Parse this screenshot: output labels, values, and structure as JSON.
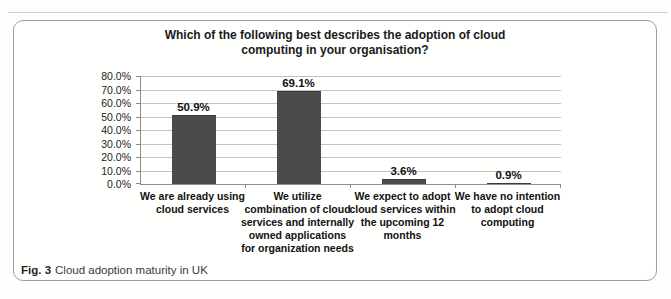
{
  "page": {
    "caption": {
      "label": "Fig. 3",
      "text": "Cloud adoption maturity in UK"
    }
  },
  "chart_data": {
    "type": "bar",
    "title": "Which of the following best describes the adoption of cloud computing in your organisation?",
    "categories": [
      "We are already using cloud services",
      "We utilize combination of cloud services and internally owned applications for organization needs",
      "We expect to adopt cloud services within the upcoming 12 months",
      "We have no intention to adopt cloud computing"
    ],
    "categories_wrapped": [
      [
        "We are already using",
        "cloud services"
      ],
      [
        "We utilize",
        "combination of cloud",
        "services and internally",
        "owned applications",
        "for organization needs"
      ],
      [
        "We expect to adopt",
        "cloud services within",
        "the upcoming 12",
        "months"
      ],
      [
        "We have no intention",
        "to adopt cloud",
        "computing"
      ]
    ],
    "values": [
      50.9,
      69.1,
      3.6,
      0.9
    ],
    "value_labels": [
      "50.9%",
      "69.1%",
      "3.6%",
      "0.9%"
    ],
    "xlabel": "",
    "ylabel": "",
    "ylim": [
      0,
      80
    ],
    "ytick_step": 10,
    "ytick_labels": [
      "0.0%",
      "10.0%",
      "20.0%",
      "30.0%",
      "40.0%",
      "50.0%",
      "60.0%",
      "70.0%",
      "80.0%"
    ],
    "grid": true,
    "legend_position": "none",
    "bar_color": "#4b4b4b",
    "gridline_color": "#c3c3c3",
    "axis_color": "#8c8c8c"
  }
}
